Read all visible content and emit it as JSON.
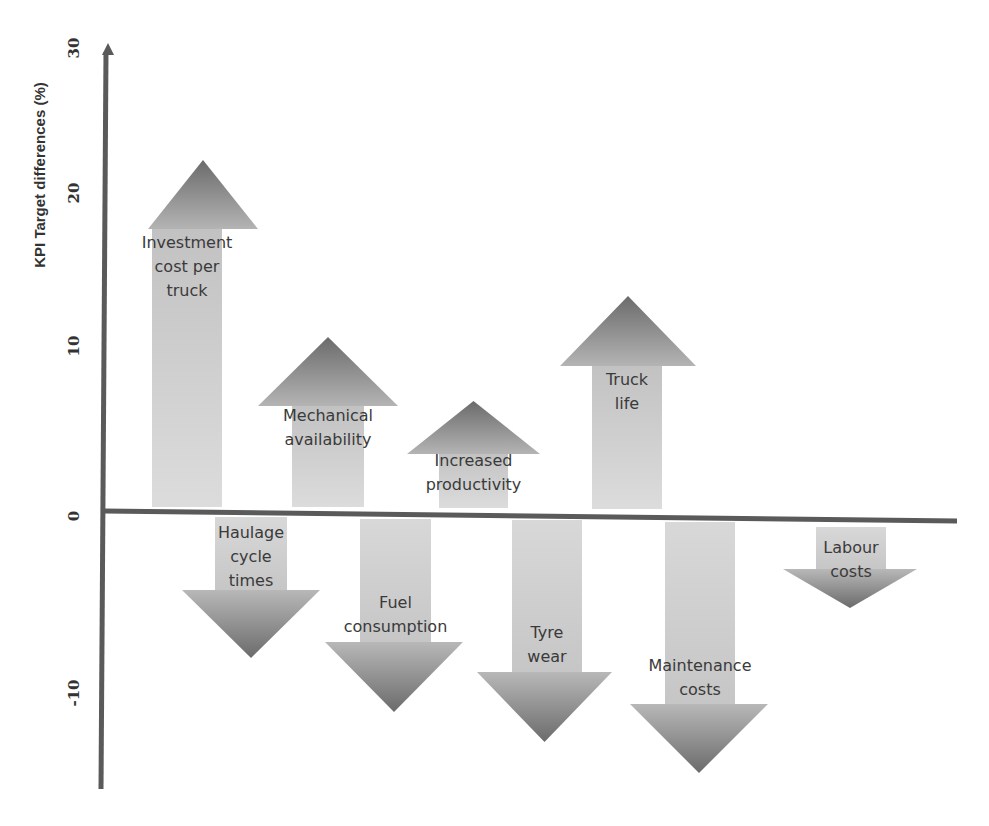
{
  "chart_data": {
    "type": "bar",
    "subtype": "arrow-bar (up/down arrows showing positive/negative change)",
    "title": "",
    "xlabel": "",
    "ylabel": "KPI Target differences (%)",
    "ylim": [
      -15,
      30
    ],
    "yticks": [
      30,
      20,
      10,
      0,
      -10
    ],
    "ytick_labels": [
      "30",
      "20",
      "10",
      "0",
      "-10"
    ],
    "grid": false,
    "legend": null,
    "categories": [
      "Investment cost per truck",
      "Haulage cycle times",
      "Mechanical availability",
      "Fuel consumption",
      "Increased productivity",
      "Tyre wear",
      "Truck life",
      "Maintenance costs",
      "Labour costs"
    ],
    "values": [
      22,
      -8,
      10.5,
      -11,
      6.8,
      -12.8,
      13.3,
      -14.5,
      -5.2
    ],
    "colors": {
      "arrow_head_dark": "#6b6b6b",
      "arrow_head_light": "#b0b0b0",
      "arrow_shaft": "#d2d2d2",
      "axis": "#5a5a5a",
      "text": "#3a3a3a"
    }
  },
  "axis": {
    "ylabel": "KPI Target differences (%)",
    "ticks": [
      {
        "label": "30",
        "y": 48
      },
      {
        "label": "20",
        "y": 193
      },
      {
        "label": "10",
        "y": 346
      },
      {
        "label": "0",
        "y": 516
      },
      {
        "label": "-10",
        "y": 693
      }
    ]
  },
  "arrows": [
    {
      "id": "investment",
      "dir": "up",
      "lines": [
        "Investment",
        "cost per",
        "truck"
      ],
      "shaft": [
        152,
        222
      ],
      "head": [
        148,
        258
      ],
      "base": 507,
      "neck": 229,
      "tip": 160,
      "text_y": 248
    },
    {
      "id": "haulage",
      "dir": "down",
      "lines": [
        "Haulage",
        "cycle",
        "times"
      ],
      "shaft": [
        215,
        287
      ],
      "head": [
        182,
        320
      ],
      "base": 517,
      "neck": 590,
      "tip": 658,
      "text_y": 538
    },
    {
      "id": "mechanical",
      "dir": "up",
      "lines": [
        "Mechanical",
        "availability"
      ],
      "shaft": [
        292,
        364
      ],
      "head": [
        258,
        398
      ],
      "base": 507,
      "neck": 406,
      "tip": 337,
      "text_y": 421
    },
    {
      "id": "fuel",
      "dir": "down",
      "lines": [
        "Fuel",
        "consumption"
      ],
      "shaft": [
        360,
        431
      ],
      "head": [
        325,
        463
      ],
      "base": 519,
      "neck": 642,
      "tip": 712,
      "text_y": 608
    },
    {
      "id": "productivity",
      "dir": "up",
      "lines": [
        "Increased",
        "productivity"
      ],
      "shaft": [
        439,
        508
      ],
      "head": [
        407,
        540
      ],
      "base": 508,
      "neck": 454,
      "tip": 401,
      "text_y": 466
    },
    {
      "id": "tyre",
      "dir": "down",
      "lines": [
        "Tyre",
        "wear"
      ],
      "shaft": [
        512,
        582
      ],
      "head": [
        477,
        612
      ],
      "base": 520,
      "neck": 672,
      "tip": 742,
      "text_y": 638
    },
    {
      "id": "truck_life",
      "dir": "up",
      "lines": [
        "Truck",
        "life"
      ],
      "shaft": [
        592,
        662
      ],
      "head": [
        560,
        696
      ],
      "base": 509,
      "neck": 366,
      "tip": 296,
      "text_y": 385
    },
    {
      "id": "maintenance",
      "dir": "down",
      "lines": [
        "Maintenance",
        "costs"
      ],
      "shaft": [
        665,
        735
      ],
      "head": [
        630,
        768
      ],
      "base": 522,
      "neck": 704,
      "tip": 773,
      "text_y": 671
    },
    {
      "id": "labour",
      "dir": "down",
      "lines": [
        "Labour",
        "costs"
      ],
      "shaft": [
        816,
        886
      ],
      "head": [
        783,
        917
      ],
      "base": 527,
      "neck": 569,
      "tip": 608,
      "text_y": 553
    }
  ]
}
